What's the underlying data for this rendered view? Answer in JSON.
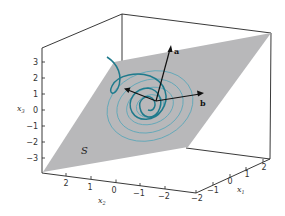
{
  "figure": {
    "type": "3d-plot",
    "plane_label": "S",
    "vectors": [
      {
        "name": "a",
        "label": "a"
      },
      {
        "name": "b",
        "label": "b"
      }
    ],
    "axes": {
      "x3": {
        "label": "x",
        "subscript": "3",
        "ticks": [
          "3",
          "2",
          "1",
          "0",
          "−1",
          "−2",
          "−3"
        ]
      },
      "x2": {
        "label": "x",
        "subscript": "2",
        "ticks": [
          "2",
          "1",
          "0",
          "−1",
          "−2"
        ]
      },
      "x1": {
        "label": "x",
        "subscript": "1",
        "ticks": [
          "−2",
          "−1",
          "0",
          "1",
          "2"
        ]
      }
    },
    "colors": {
      "plane": "#b8b8ba",
      "curve": "#1f7a8c",
      "contour": "#5aa6b8",
      "axis": "#222222",
      "vector": "#111111"
    }
  }
}
